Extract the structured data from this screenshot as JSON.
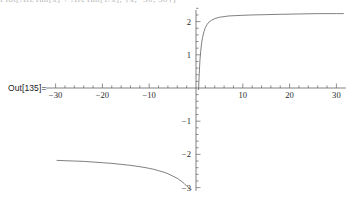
{
  "notebook": {
    "out_label": "Out[135]=",
    "cutoff_input_text": "Plot[ArcTan[x] + ArcTan[1/x], {x, -30, 30}]"
  },
  "chart_data": {
    "type": "line",
    "title": "",
    "xlabel": "",
    "ylabel": "",
    "xlim": [
      -32,
      32
    ],
    "ylim": [
      -3.1,
      2.35
    ],
    "grid": false,
    "legend": null,
    "x_ticks_major": [
      -30,
      -20,
      -10,
      10,
      20,
      30
    ],
    "x_tick_labels": [
      "-30",
      "-20",
      "-10",
      "10",
      "20",
      "30"
    ],
    "y_ticks_major": [
      2,
      1,
      -1,
      -2,
      -3
    ],
    "y_tick_labels": [
      "2",
      "1",
      "-1",
      "-2",
      "-3"
    ],
    "x_minor_step": 2,
    "y_minor_step": 0.2,
    "axis_color": "#4a4a4a",
    "curve_color": "#555555",
    "background": "#ffffff",
    "series": [
      {
        "name": "branch-lower-left",
        "points": [
          [
            -29.7,
            -2.18
          ],
          [
            -28.0,
            -2.19
          ],
          [
            -26.0,
            -2.2
          ],
          [
            -24.0,
            -2.21
          ],
          [
            -22.0,
            -2.23
          ],
          [
            -20.0,
            -2.25
          ],
          [
            -18.0,
            -2.27
          ],
          [
            -16.0,
            -2.3
          ],
          [
            -14.0,
            -2.33
          ],
          [
            -12.0,
            -2.37
          ],
          [
            -10.0,
            -2.42
          ],
          [
            -9.0,
            -2.45
          ],
          [
            -8.0,
            -2.49
          ],
          [
            -7.0,
            -2.53
          ],
          [
            -6.0,
            -2.58
          ],
          [
            -5.0,
            -2.65
          ],
          [
            -4.0,
            -2.72
          ],
          [
            -3.5,
            -2.77
          ],
          [
            -3.0,
            -2.82
          ],
          [
            -2.5,
            -2.88
          ],
          [
            -2.0,
            -2.95
          ],
          [
            -1.6,
            -3.0
          ],
          [
            -1.3,
            -3.03
          ],
          [
            -1.0,
            -3.05
          ]
        ]
      },
      {
        "name": "branch-upper-right",
        "points": [
          [
            0.55,
            -0.05
          ],
          [
            0.7,
            0.45
          ],
          [
            0.85,
            0.85
          ],
          [
            1.0,
            1.1
          ],
          [
            1.2,
            1.35
          ],
          [
            1.4,
            1.52
          ],
          [
            1.7,
            1.7
          ],
          [
            2.0,
            1.82
          ],
          [
            2.4,
            1.92
          ],
          [
            2.8,
            1.99
          ],
          [
            3.3,
            2.04
          ],
          [
            4.0,
            2.09
          ],
          [
            5.0,
            2.13
          ],
          [
            6.0,
            2.15
          ],
          [
            7.0,
            2.17
          ],
          [
            8.5,
            2.18
          ],
          [
            10.0,
            2.19
          ],
          [
            12.0,
            2.2
          ],
          [
            15.0,
            2.21
          ],
          [
            18.0,
            2.22
          ],
          [
            22.0,
            2.23
          ],
          [
            26.0,
            2.24
          ],
          [
            30.0,
            2.24
          ],
          [
            31.5,
            2.24
          ]
        ]
      }
    ]
  }
}
